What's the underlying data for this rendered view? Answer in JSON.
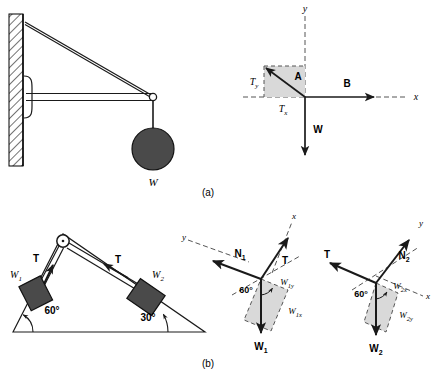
{
  "figure": {
    "caption_a": "(a)",
    "caption_b": "(b)"
  },
  "colors": {
    "line": "#1a1a1a",
    "block_fill": "#4a4a4a",
    "ball_fill": "#4a4a4a",
    "shade_fill": "#d9d9d9",
    "dash": "#555555",
    "hatch": "#000000",
    "background": "#ffffff"
  },
  "panel_a": {
    "bracket_diagram": {
      "weight_label": "W"
    },
    "free_body": {
      "axis_x_label": "x",
      "axis_y_label": "y",
      "vector_a_label": "A",
      "vector_b_label": "B",
      "vector_w_label": "W",
      "component_x_label": "T",
      "component_x_sub": "x",
      "component_y_label": "T",
      "component_y_sub": "y"
    }
  },
  "panel_b": {
    "incline": {
      "angle_left": "60°",
      "angle_right": "30°",
      "tension_left_label": "T",
      "tension_right_label": "T",
      "block1_label": "W",
      "block1_sub": "1",
      "block2_label": "W",
      "block2_sub": "2"
    },
    "fbd_left": {
      "axis_x_label": "x",
      "axis_y_label": "y",
      "normal_label": "N",
      "normal_sub": "1",
      "tension_label": "T",
      "weight_label": "W",
      "weight_sub": "1",
      "angle_label": "60°",
      "comp_a_label": "W",
      "comp_a_sub": "1y",
      "comp_b_label": "W",
      "comp_b_sub": "1x"
    },
    "fbd_right": {
      "axis_x_label": "x",
      "axis_y_label": "y",
      "normal_label": "N",
      "normal_sub": "2",
      "tension_label": "T",
      "weight_label": "W",
      "weight_sub": "2",
      "angle_label": "60°",
      "comp_a_label": "W",
      "comp_a_sub": "2x",
      "comp_b_label": "W",
      "comp_b_sub": "2y"
    }
  }
}
